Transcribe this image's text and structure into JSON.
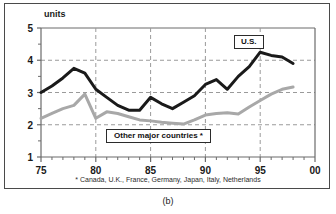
{
  "figure": {
    "caption": "(b)",
    "footnote": "* Canada, U.K., France, Germany, Japan, Italy, Netherlands",
    "y_axis_title": "units"
  },
  "callouts": {
    "us": "U.S.",
    "other": "Other major countries *"
  },
  "colors": {
    "us_line": "#1a1a1a",
    "other_line": "#a8a8a8",
    "axis": "#6b6b6b",
    "grid": "#9a9a9a",
    "frame": "#4a4a4a",
    "text": "#1a1a1a",
    "background": "#ffffff"
  },
  "chart_data": {
    "type": "line",
    "title": "",
    "subtitle": "",
    "xlabel": "",
    "ylabel": "units",
    "xlim": [
      75,
      100
    ],
    "ylim": [
      1,
      5
    ],
    "xticks": [
      75,
      80,
      85,
      90,
      95,
      100
    ],
    "xtick_labels": [
      "75",
      "80",
      "85",
      "90",
      "95",
      "00"
    ],
    "xminor_ticks": [
      76,
      77,
      78,
      79,
      81,
      82,
      83,
      84,
      86,
      87,
      88,
      89,
      91,
      92,
      93,
      94,
      96,
      97,
      98,
      99
    ],
    "yticks": [
      1,
      2,
      3,
      4,
      5
    ],
    "ytick_labels": [
      "1",
      "2",
      "3",
      "4",
      "5"
    ],
    "yminor_ticks": [
      1.5,
      2.5,
      3.5,
      4.5
    ],
    "grid": "horizontal-dashed-and-vertical-dashed-at-major-x",
    "legend": "inline-callout-boxes",
    "x": [
      75,
      76,
      77,
      78,
      79,
      80,
      81,
      82,
      83,
      84,
      85,
      86,
      87,
      88,
      89,
      90,
      91,
      92,
      93,
      94,
      95,
      96,
      97,
      98
    ],
    "series": [
      {
        "name": "U.S.",
        "color": "#1a1a1a",
        "values": [
          3.0,
          3.2,
          3.45,
          3.75,
          3.6,
          3.1,
          2.85,
          2.6,
          2.45,
          2.45,
          2.85,
          2.65,
          2.5,
          2.7,
          2.9,
          3.25,
          3.4,
          3.1,
          3.5,
          3.8,
          4.25,
          4.15,
          4.1,
          3.9
        ]
      },
      {
        "name": "Other major countries *",
        "color": "#a8a8a8",
        "values": [
          2.2,
          2.35,
          2.5,
          2.6,
          2.95,
          2.2,
          2.4,
          2.35,
          2.25,
          2.15,
          2.12,
          2.08,
          2.05,
          2.02,
          2.15,
          2.3,
          2.35,
          2.37,
          2.33,
          2.55,
          2.75,
          2.95,
          3.1,
          3.17
        ]
      }
    ],
    "series_note": "U.S. series ends 1998 at about 4.0 after a small uptick; other-countries series ends 1998 at about 3.1"
  }
}
